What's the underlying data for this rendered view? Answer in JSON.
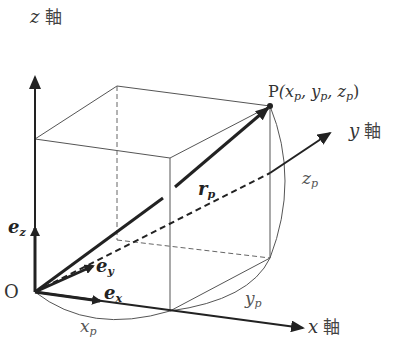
{
  "diagram": {
    "type": "3d-coordinate-system",
    "axes": {
      "z": {
        "var": "z",
        "suffix": "軸"
      },
      "y": {
        "var": "y",
        "suffix": "軸"
      },
      "x": {
        "var": "x",
        "suffix": "軸"
      }
    },
    "origin": {
      "label": "O"
    },
    "point": {
      "name": "P",
      "coords": "(x",
      "c1": "p",
      "sep1": ", y",
      "c2": "p",
      "sep2": ", z",
      "c3": "p",
      "close": ")"
    },
    "position_vector": {
      "base": "r",
      "sub": "p"
    },
    "unit_vectors": {
      "ez": {
        "base": "e",
        "sub": "z"
      },
      "ey": {
        "base": "e",
        "sub": "y"
      },
      "ex": {
        "base": "e",
        "sub": "x"
      }
    },
    "components": {
      "xp": {
        "base": "x",
        "sub": "p"
      },
      "yp": {
        "base": "y",
        "sub": "p"
      },
      "zp": {
        "base": "z",
        "sub": "p"
      }
    },
    "colors": {
      "line": "#222222",
      "thin": "#555555",
      "text": "#333333"
    }
  }
}
